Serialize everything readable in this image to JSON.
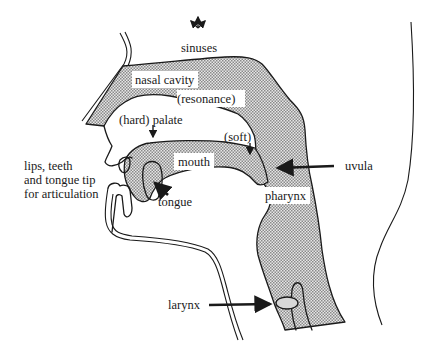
{
  "diagram": {
    "colors": {
      "stipple": "#9a9a9a",
      "stipple_bg": "#e4e4e4",
      "ink": "#1a1a1a",
      "larynx_fill": "#d8d8d8"
    },
    "labels": {
      "sinuses": "sinuses",
      "nasal_cavity": "nasal cavity",
      "resonance": "(resonance)",
      "hard_palate": "(hard) palate",
      "soft": "(soft)",
      "mouth": "mouth",
      "uvula": "uvula",
      "tongue": "tongue",
      "pharynx": "pharynx",
      "larynx": "larynx",
      "articulation_line1": "lips, teeth",
      "articulation_line2": "and tongue tip",
      "articulation_line3": "for articulation"
    },
    "icons": {
      "sinuses": "three-way-arrows-icon"
    }
  }
}
